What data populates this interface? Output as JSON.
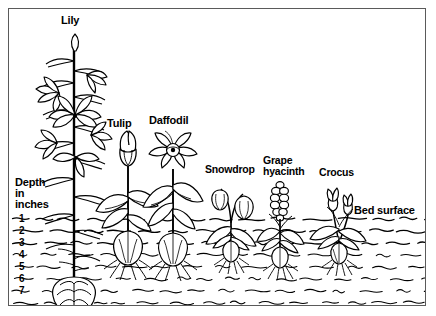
{
  "figure": {
    "type": "diagram",
    "surface_label": "Bed surface",
    "depth_axis": {
      "title_lines": [
        "Depth",
        "in",
        "inches"
      ],
      "unit": "inches",
      "ticks": [
        "1",
        "2",
        "3",
        "4",
        "5",
        "6",
        "7"
      ]
    },
    "plants": [
      {
        "label": "Lily",
        "depth_inches": 7
      },
      {
        "label": "Tulip",
        "depth_inches": 5
      },
      {
        "label": "Daffodil",
        "depth_inches": 5
      },
      {
        "label": "Snowdrop",
        "depth_inches": 3
      },
      {
        "label": "Grape\nhyacinth",
        "depth_inches": 3
      },
      {
        "label": "Crocus",
        "depth_inches": 3
      }
    ],
    "colors": {
      "ink": "#000000",
      "border": "#5a5a5a",
      "background": "#ffffff"
    }
  }
}
